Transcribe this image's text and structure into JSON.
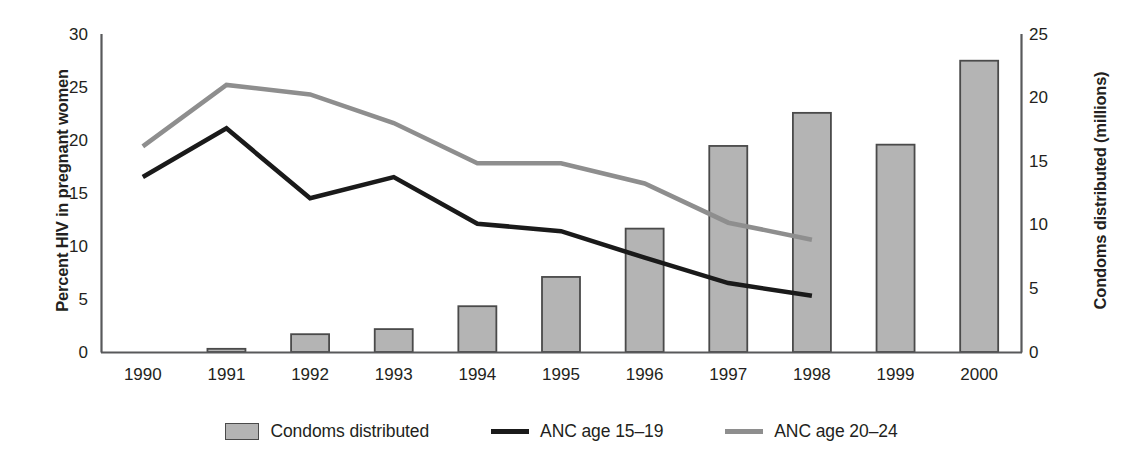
{
  "chart_data": {
    "type": "bar",
    "title": "",
    "xlabel": "",
    "categories": [
      "1990",
      "1991",
      "1992",
      "1993",
      "1994",
      "1995",
      "1996",
      "1997",
      "1998",
      "1999",
      "2000"
    ],
    "grid": false,
    "legend_position": "bottom",
    "axes": {
      "left": {
        "label": "Percent HIV in pregnant women",
        "ticks": [
          "0",
          "5",
          "10",
          "15",
          "20",
          "25",
          "30"
        ],
        "tick_values": [
          0,
          5,
          10,
          15,
          20,
          25,
          30
        ],
        "ylim": [
          0,
          30
        ]
      },
      "right": {
        "label": "Condoms distributed (millions)",
        "ticks": [
          "0",
          "5",
          "10",
          "15",
          "20",
          "25"
        ],
        "tick_values": [
          0,
          5,
          10,
          15,
          20,
          25
        ],
        "ylim": [
          0,
          25
        ]
      }
    },
    "series": [
      {
        "name": "Condoms distributed",
        "type": "bar",
        "axis": "right",
        "unit": "millions",
        "color": "#b4b4b4",
        "edge_color": "#4a4a4a",
        "values": [
          null,
          0.25,
          1.4,
          1.8,
          3.6,
          5.9,
          9.7,
          16.2,
          18.8,
          16.3,
          22.9
        ]
      },
      {
        "name": "ANC age 15–19",
        "type": "line",
        "axis": "left",
        "unit": "percent",
        "color": "#1a1a1a",
        "values": [
          16.5,
          21.1,
          14.5,
          16.5,
          12.1,
          11.4,
          8.9,
          6.5,
          5.3,
          null,
          null
        ]
      },
      {
        "name": "ANC age 20–24",
        "type": "line",
        "axis": "left",
        "unit": "percent",
        "color": "#8e8e8e",
        "values": [
          19.4,
          25.2,
          24.3,
          21.6,
          17.8,
          17.8,
          15.9,
          12.2,
          10.6,
          null,
          null
        ]
      }
    ]
  },
  "legend": [
    {
      "label": "Condoms distributed",
      "marker": "bar-swatch"
    },
    {
      "label": "ANC age 15–19",
      "marker": "line-swatch-dark"
    },
    {
      "label": "ANC age 20–24",
      "marker": "line-swatch-grey"
    }
  ]
}
